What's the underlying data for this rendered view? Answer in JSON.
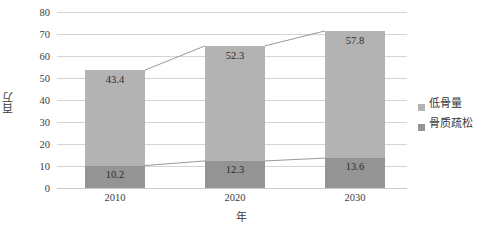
{
  "chart_data": {
    "type": "bar",
    "title": "",
    "xlabel": "年",
    "ylabel": "百万",
    "categories": [
      "2010",
      "2020",
      "2030"
    ],
    "series": [
      {
        "name": "骨质疏松",
        "values": [
          10.2,
          12.3,
          13.6
        ],
        "color": "#949494",
        "stack_position": "bottom"
      },
      {
        "name": "低骨量",
        "values": [
          43.4,
          52.3,
          57.8
        ],
        "color": "#b3b3b3",
        "stack_position": "top"
      }
    ],
    "stacked": true,
    "totals": [
      53.6,
      64.6,
      71.4
    ],
    "ylim": [
      0,
      80
    ],
    "yticks": [
      0,
      10,
      20,
      30,
      40,
      50,
      60,
      70,
      80
    ],
    "ytick_labels": [
      "0",
      "10",
      "20",
      "30",
      "40",
      "50",
      "60",
      "70",
      "80"
    ],
    "grid": true,
    "grid_color": "#d4d4d4",
    "legend_position": "right",
    "has_connector_lines": true,
    "connector_color": "#8d8d8d",
    "data_label_color": "#2b2b2b",
    "background": "#ffffff"
  },
  "legend": {
    "items": [
      {
        "label": "低骨量",
        "color": "#b3b3b3"
      },
      {
        "label": "骨质疏松",
        "color": "#949494"
      }
    ]
  },
  "axes": {
    "y_title": "百万",
    "x_title": "年"
  }
}
